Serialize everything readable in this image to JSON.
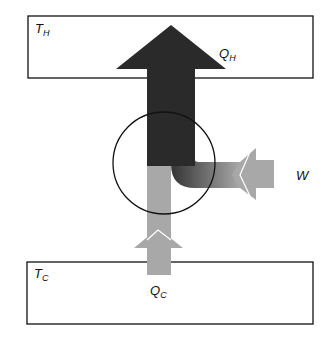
{
  "diagram": {
    "hot_reservoir": {
      "label": "T",
      "subscript": "H"
    },
    "cold_reservoir": {
      "label": "T",
      "subscript": "C"
    },
    "heat_out": {
      "label": "Q",
      "subscript": "H"
    },
    "heat_in": {
      "label": "Q",
      "subscript": "C"
    },
    "work_in": {
      "label": "W"
    },
    "colors": {
      "dark_flow": "#2a2a2a",
      "light_flow": "#a8a8a8",
      "outline": "#111111"
    }
  }
}
